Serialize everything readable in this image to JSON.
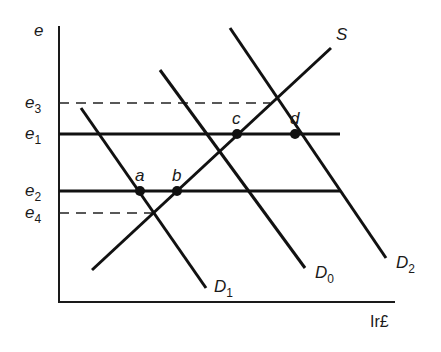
{
  "diagram": {
    "type": "supply-demand",
    "axes": {
      "y_label": "e",
      "x_label": "Ir£",
      "origin": [
        59,
        302
      ],
      "y_top": 26,
      "x_right": 395
    },
    "levels": [
      {
        "id": "e3",
        "base": "e",
        "sub": "3",
        "y": 103,
        "x_end": 270,
        "style": "dashed"
      },
      {
        "id": "e1",
        "base": "e",
        "sub": "1",
        "y": 134,
        "x_end": 340,
        "style": "solid"
      },
      {
        "id": "e2",
        "base": "e",
        "sub": "2",
        "y": 191,
        "x_end": 340,
        "style": "solid"
      },
      {
        "id": "e4",
        "base": "e",
        "sub": "4",
        "y": 213,
        "x_end": 155,
        "style": "dashed"
      }
    ],
    "curves": [
      {
        "id": "S",
        "base": "S",
        "sub": "",
        "x1": 92,
        "y1": 270,
        "x2": 331,
        "y2": 48,
        "label_x": 336,
        "label_y": 40
      },
      {
        "id": "D1",
        "base": "D",
        "sub": "1",
        "x1": 81,
        "y1": 108,
        "x2": 206,
        "y2": 288,
        "label_x": 214,
        "label_y": 292
      },
      {
        "id": "D0",
        "base": "D",
        "sub": "0",
        "x1": 160,
        "y1": 70,
        "x2": 305,
        "y2": 268,
        "label_x": 315,
        "label_y": 278
      },
      {
        "id": "D2",
        "base": "D",
        "sub": "2",
        "x1": 230,
        "y1": 28,
        "x2": 386,
        "y2": 258,
        "label_x": 396,
        "label_y": 268
      }
    ],
    "points": [
      {
        "id": "a",
        "label": "a",
        "x": 140,
        "y": 191
      },
      {
        "id": "b",
        "label": "b",
        "x": 177,
        "y": 191
      },
      {
        "id": "c",
        "label": "c",
        "x": 237,
        "y": 134
      },
      {
        "id": "d",
        "label": "d",
        "x": 295,
        "y": 134
      }
    ]
  }
}
